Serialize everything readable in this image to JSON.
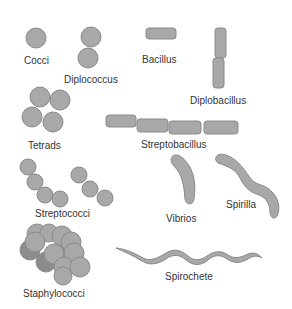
{
  "colors": {
    "fill": "#a8a8a8",
    "stroke": "#8a8a8a",
    "dark_fill": "#8c8c8c",
    "label": "#333333"
  },
  "labels": {
    "cocci": "Cocci",
    "diplococcus": "Diplococcus",
    "bacillus": "Bacillus",
    "diplobacillus": "Diplobacillus",
    "tetrads": "Tetrads",
    "streptobacillus": "Streptobacillus",
    "streptococci": "Streptococci",
    "vibrios": "Vibrios",
    "spirilla": "Spirilla",
    "staphylococci": "Staphylococci",
    "spirochete": "Spirochete"
  }
}
